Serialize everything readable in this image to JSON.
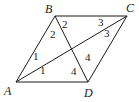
{
  "figure": {
    "type": "parallelogram-with-diagonals",
    "stroke_color": "#1a1a1a",
    "background": "#ffffff",
    "vertices": [
      {
        "name": "A",
        "x": 16,
        "y": 82,
        "label_x": 4,
        "label_y": 95
      },
      {
        "name": "B",
        "x": 55,
        "y": 16,
        "label_x": 45,
        "label_y": 13
      },
      {
        "name": "C",
        "x": 127,
        "y": 16,
        "label_x": 126,
        "label_y": 12
      },
      {
        "name": "D",
        "x": 88,
        "y": 82,
        "label_x": 84,
        "label_y": 97
      }
    ],
    "edges": [
      [
        "A",
        "B"
      ],
      [
        "B",
        "C"
      ],
      [
        "C",
        "D"
      ],
      [
        "D",
        "A"
      ],
      [
        "A",
        "C"
      ],
      [
        "B",
        "D"
      ]
    ],
    "angle_labels": [
      {
        "text": "2",
        "x": 50,
        "y": 38,
        "vertex": "B"
      },
      {
        "text": "2",
        "x": 62,
        "y": 28,
        "vertex": "B"
      },
      {
        "text": "3",
        "x": 98,
        "y": 26,
        "vertex": "C"
      },
      {
        "text": "3",
        "x": 104,
        "y": 37,
        "vertex": "C"
      },
      {
        "text": "1",
        "x": 33,
        "y": 60,
        "vertex": "A"
      },
      {
        "text": "1",
        "x": 40,
        "y": 74,
        "vertex": "A"
      },
      {
        "text": "4",
        "x": 85,
        "y": 61,
        "vertex": "D"
      },
      {
        "text": "4",
        "x": 71,
        "y": 75,
        "vertex": "D"
      }
    ]
  }
}
